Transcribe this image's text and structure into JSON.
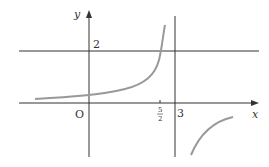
{
  "figure": {
    "axes": {
      "x_label": "x",
      "y_label": "y",
      "origin_label": "O"
    },
    "asymptotes": {
      "horizontal_value_label": "2",
      "vertical_value_label": "3"
    },
    "tick": {
      "num": "5",
      "den": "2"
    },
    "colors": {
      "axis": "#333333",
      "curve": "#999999"
    }
  }
}
